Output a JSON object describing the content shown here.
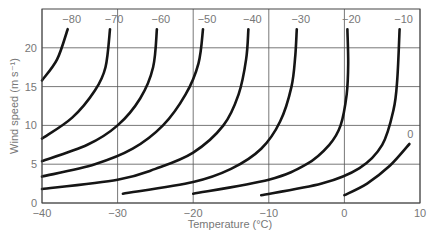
{
  "chart_data": {
    "type": "line",
    "title": "",
    "xlabel": "Temperature (°C)",
    "ylabel": "Wind speed (m s⁻¹)",
    "xlim": [
      -40,
      10
    ],
    "ylim": [
      0,
      25
    ],
    "xticks": [
      -40,
      -30,
      -20,
      -10,
      0,
      10
    ],
    "yticks": [
      0,
      5,
      10,
      15,
      20
    ],
    "grid": true,
    "legend": "none (curves labeled inline)",
    "series": [
      {
        "name": "-80",
        "points": [
          [
            -40,
            15.8
          ],
          [
            -38,
            18.5
          ],
          [
            -36.6,
            22.4
          ]
        ]
      },
      {
        "name": "-70",
        "points": [
          [
            -40,
            8.3
          ],
          [
            -36,
            11
          ],
          [
            -33,
            14.5
          ],
          [
            -31.6,
            17.5
          ],
          [
            -31,
            22.4
          ]
        ]
      },
      {
        "name": "-60",
        "points": [
          [
            -40,
            5.4
          ],
          [
            -34,
            7.5
          ],
          [
            -30,
            10
          ],
          [
            -27,
            13.5
          ],
          [
            -25.3,
            17.5
          ],
          [
            -24.8,
            22.4
          ]
        ]
      },
      {
        "name": "-50",
        "points": [
          [
            -40,
            3.4
          ],
          [
            -33,
            5
          ],
          [
            -28,
            7
          ],
          [
            -24,
            10
          ],
          [
            -21,
            14
          ],
          [
            -19.3,
            18
          ],
          [
            -18.7,
            22.4
          ]
        ]
      },
      {
        "name": "-40",
        "points": [
          [
            -40,
            1.8
          ],
          [
            -30,
            3
          ],
          [
            -25,
            4.4
          ],
          [
            -20,
            6.5
          ],
          [
            -16,
            10
          ],
          [
            -14,
            14
          ],
          [
            -13,
            18.5
          ],
          [
            -12.7,
            22.4
          ]
        ]
      },
      {
        "name": "-30",
        "points": [
          [
            -29.3,
            1.2
          ],
          [
            -20,
            2.7
          ],
          [
            -15,
            4.4
          ],
          [
            -11,
            7
          ],
          [
            -8.5,
            10.5
          ],
          [
            -7,
            15
          ],
          [
            -6.5,
            19
          ],
          [
            -6.3,
            22.4
          ]
        ]
      },
      {
        "name": "-20",
        "points": [
          [
            -20,
            1.2
          ],
          [
            -10,
            3
          ],
          [
            -5,
            5
          ],
          [
            -2,
            7.5
          ],
          [
            -0.5,
            10
          ],
          [
            0.3,
            14
          ],
          [
            0.5,
            18
          ],
          [
            0.4,
            22.4
          ]
        ]
      },
      {
        "name": "-10",
        "points": [
          [
            -11,
            1.0
          ],
          [
            -3,
            2.5
          ],
          [
            2,
            4.5
          ],
          [
            5,
            7.5
          ],
          [
            6.5,
            12
          ],
          [
            7,
            16
          ],
          [
            7.3,
            22.4
          ]
        ]
      },
      {
        "name": "0",
        "points": [
          [
            0,
            1.0
          ],
          [
            3,
            2.5
          ],
          [
            6,
            4.8
          ],
          [
            8.6,
            7.6
          ]
        ]
      }
    ]
  }
}
